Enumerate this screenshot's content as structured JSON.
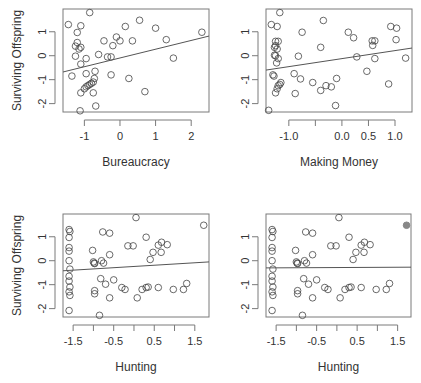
{
  "figure": {
    "ylabel": "Surviving Offspring"
  },
  "chart_data": [
    {
      "type": "scatter",
      "panel": "top-left",
      "title": "",
      "xlabel": "Bureaucracy",
      "ylabel": "Surviving Offspring",
      "xticks": [
        -1,
        0,
        1,
        2
      ],
      "xtick_labels": [
        "-1",
        "0",
        "1",
        "2"
      ],
      "yticks": [
        -2,
        -1,
        0,
        1
      ],
      "ytick_labels": [
        "-2",
        "-1",
        "0",
        "1"
      ],
      "xlim": [
        -1.6,
        2.5
      ],
      "ylim": [
        -2.35,
        1.95
      ],
      "frame_px": {
        "left": 63,
        "right": 209,
        "top": 9,
        "bottom": 112
      },
      "regression_line": {
        "x": [
          -1.6,
          2.5
        ],
        "y": [
          -0.68,
          0.82
        ]
      },
      "points": [
        [
          -1.45,
          1.3
        ],
        [
          -1.1,
          1.25
        ],
        [
          -0.85,
          1.8
        ],
        [
          -1.2,
          0.97
        ],
        [
          -1.25,
          0.4
        ],
        [
          -1.2,
          0.55
        ],
        [
          -1.1,
          0.35
        ],
        [
          -1.15,
          0.28
        ],
        [
          -1.25,
          -0.02
        ],
        [
          -1.1,
          -0.35
        ],
        [
          -0.95,
          -0.12
        ],
        [
          -0.6,
          0.05
        ],
        [
          -0.35,
          -0.05
        ],
        [
          -0.25,
          -0.05
        ],
        [
          -0.45,
          0.62
        ],
        [
          -0.1,
          0.78
        ],
        [
          0.0,
          0.62
        ],
        [
          -0.2,
          0.42
        ],
        [
          0.15,
          1.22
        ],
        [
          0.55,
          1.48
        ],
        [
          0.35,
          0.62
        ],
        [
          1.0,
          1.15
        ],
        [
          1.3,
          0.67
        ],
        [
          1.5,
          -0.1
        ],
        [
          2.3,
          0.98
        ],
        [
          -1.35,
          -0.85
        ],
        [
          -0.95,
          -0.75
        ],
        [
          -0.7,
          -0.65
        ],
        [
          -0.25,
          -0.8
        ],
        [
          0.25,
          -0.95
        ],
        [
          0.7,
          -1.5
        ],
        [
          -0.72,
          -0.95
        ],
        [
          -0.75,
          -1.1
        ],
        [
          -0.8,
          -1.15
        ],
        [
          -0.85,
          -1.2
        ],
        [
          -0.9,
          -1.25
        ],
        [
          -0.95,
          -1.3
        ],
        [
          -1.0,
          -1.38
        ],
        [
          -0.75,
          -1.55
        ],
        [
          -1.1,
          -1.55
        ],
        [
          -0.68,
          -2.1
        ],
        [
          -1.12,
          -2.3
        ]
      ]
    },
    {
      "type": "scatter",
      "panel": "top-right",
      "title": "",
      "xlabel": "Making Money",
      "ylabel": "",
      "xticks": [
        -1.0,
        -0.5,
        0.0,
        0.5,
        1.0
      ],
      "xtick_labels": [
        "-1.0",
        "",
        "0.0",
        "0.5",
        "1.0"
      ],
      "yticks": [
        -2,
        -1,
        0,
        1
      ],
      "ytick_labels": [
        "-2",
        "-1",
        "0",
        "1"
      ],
      "xlim": [
        -1.43,
        1.32
      ],
      "ylim": [
        -2.35,
        1.95
      ],
      "frame_px": {
        "left": 266,
        "right": 412,
        "top": 9,
        "bottom": 112
      },
      "regression_line": {
        "x": [
          -1.43,
          1.32
        ],
        "y": [
          -0.6,
          0.32
        ]
      },
      "points": [
        [
          -1.33,
          1.3
        ],
        [
          -1.22,
          1.22
        ],
        [
          -1.17,
          1.8
        ],
        [
          -0.75,
          0.98
        ],
        [
          -0.35,
          1.47
        ],
        [
          0.12,
          0.98
        ],
        [
          0.22,
          0.75
        ],
        [
          0.57,
          0.62
        ],
        [
          0.62,
          0.62
        ],
        [
          0.58,
          0.43
        ],
        [
          0.92,
          1.22
        ],
        [
          1.03,
          1.15
        ],
        [
          1.02,
          0.67
        ],
        [
          1.2,
          -0.1
        ],
        [
          0.28,
          -0.05
        ],
        [
          0.62,
          -0.12
        ],
        [
          -1.25,
          0.6
        ],
        [
          -1.2,
          0.6
        ],
        [
          -1.25,
          0.42
        ],
        [
          -1.27,
          0.35
        ],
        [
          -1.22,
          0.28
        ],
        [
          -1.27,
          0.02
        ],
        [
          -1.25,
          0.0
        ],
        [
          -1.2,
          -0.12
        ],
        [
          -1.23,
          -0.3
        ],
        [
          -0.82,
          -0.02
        ],
        [
          -0.4,
          0.35
        ],
        [
          0.47,
          -0.65
        ],
        [
          0.88,
          -1.18
        ],
        [
          -1.3,
          -0.8
        ],
        [
          -1.28,
          -0.85
        ],
        [
          -0.9,
          -0.75
        ],
        [
          -0.78,
          -0.97
        ],
        [
          -0.55,
          -1.12
        ],
        [
          -1.15,
          -1.12
        ],
        [
          -1.17,
          -1.2
        ],
        [
          -1.2,
          -1.25
        ],
        [
          -1.22,
          -1.38
        ],
        [
          -1.25,
          -1.55
        ],
        [
          -0.88,
          -1.58
        ],
        [
          -0.4,
          -1.45
        ],
        [
          -0.3,
          -1.25
        ],
        [
          -0.2,
          -1.3
        ],
        [
          -0.1,
          -0.95
        ],
        [
          -0.12,
          -2.08
        ],
        [
          -1.38,
          -2.28
        ]
      ]
    },
    {
      "type": "scatter",
      "panel": "bottom-left",
      "title": "",
      "xlabel": "Hunting",
      "ylabel": "Surviving Offspring",
      "xticks": [
        -1.5,
        -1.0,
        -0.5,
        0.0,
        0.5,
        1.0,
        1.5
      ],
      "xtick_labels": [
        "-1.5",
        "",
        "-0.5",
        "",
        "0.5",
        "",
        "1.5"
      ],
      "yticks": [
        -2,
        -1,
        0,
        1
      ],
      "ytick_labels": [
        "-2",
        "-1",
        "0",
        "1"
      ],
      "xlim": [
        -1.75,
        1.85
      ],
      "ylim": [
        -2.35,
        1.95
      ],
      "frame_px": {
        "left": 63,
        "right": 209,
        "top": 214,
        "bottom": 317
      },
      "regression_line": {
        "x": [
          -1.75,
          1.85
        ],
        "y": [
          -0.42,
          -0.05
        ]
      },
      "points": [
        [
          -1.6,
          1.3
        ],
        [
          -1.58,
          1.22
        ],
        [
          -1.6,
          0.97
        ],
        [
          -1.6,
          0.55
        ],
        [
          -1.6,
          0.4
        ],
        [
          -1.6,
          0.0
        ],
        [
          -1.58,
          -0.35
        ],
        [
          -1.6,
          -0.65
        ],
        [
          -1.6,
          -0.85
        ],
        [
          -1.58,
          -1.1
        ],
        [
          -1.6,
          -1.3
        ],
        [
          -1.58,
          -1.45
        ],
        [
          -1.6,
          -2.08
        ],
        [
          -1.02,
          0.43
        ],
        [
          -1.0,
          -0.05
        ],
        [
          -0.98,
          -0.1
        ],
        [
          -0.97,
          -0.12
        ],
        [
          -0.8,
          0.0
        ],
        [
          -0.75,
          -0.1
        ],
        [
          -0.77,
          1.2
        ],
        [
          -0.6,
          1.15
        ],
        [
          -0.6,
          0.25
        ],
        [
          -0.15,
          0.62
        ],
        [
          -0.02,
          0.62
        ],
        [
          0.3,
          0.98
        ],
        [
          0.05,
          1.8
        ],
        [
          0.4,
          0.05
        ],
        [
          0.47,
          0.35
        ],
        [
          0.6,
          0.65
        ],
        [
          0.68,
          0.77
        ],
        [
          0.67,
          0.35
        ],
        [
          0.82,
          0.67
        ],
        [
          1.72,
          1.48
        ],
        [
          -0.82,
          -0.75
        ],
        [
          -0.7,
          -0.98
        ],
        [
          -0.5,
          -0.8
        ],
        [
          -0.3,
          -1.12
        ],
        [
          -0.22,
          -1.2
        ],
        [
          -0.97,
          -1.25
        ],
        [
          -0.97,
          -1.38
        ],
        [
          -0.6,
          -1.55
        ],
        [
          -0.85,
          -2.28
        ],
        [
          0.08,
          -1.55
        ],
        [
          0.2,
          -1.2
        ],
        [
          0.3,
          -1.12
        ],
        [
          0.35,
          -1.1
        ],
        [
          0.6,
          -1.12
        ],
        [
          0.97,
          -1.2
        ],
        [
          1.22,
          -1.2
        ],
        [
          1.3,
          -0.95
        ]
      ]
    },
    {
      "type": "scatter",
      "panel": "bottom-right",
      "title": "",
      "xlabel": "Hunting",
      "ylabel": "",
      "xticks": [
        -1.5,
        -1.0,
        -0.5,
        0.0,
        0.5,
        1.0,
        1.5
      ],
      "xtick_labels": [
        "-1.5",
        "",
        "-0.5",
        "",
        "0.5",
        "",
        "1.5"
      ],
      "yticks": [
        -2,
        -1,
        0,
        1
      ],
      "ytick_labels": [
        "-2",
        "-1",
        "0",
        "1"
      ],
      "xlim": [
        -1.75,
        1.83
      ],
      "ylim": [
        -2.35,
        1.95
      ],
      "frame_px": {
        "left": 266,
        "right": 411,
        "top": 214,
        "bottom": 317
      },
      "regression_line": {
        "x": [
          -1.75,
          1.83
        ],
        "y": [
          -0.3,
          -0.27
        ]
      },
      "highlighted_point": {
        "x": 1.72,
        "y": 1.48,
        "style": "filled-gray"
      },
      "points": [
        [
          -1.6,
          1.3
        ],
        [
          -1.58,
          1.22
        ],
        [
          -1.6,
          0.97
        ],
        [
          -1.6,
          0.55
        ],
        [
          -1.6,
          0.4
        ],
        [
          -1.6,
          0.0
        ],
        [
          -1.58,
          -0.35
        ],
        [
          -1.6,
          -0.65
        ],
        [
          -1.6,
          -0.85
        ],
        [
          -1.58,
          -1.1
        ],
        [
          -1.6,
          -1.3
        ],
        [
          -1.58,
          -1.45
        ],
        [
          -1.6,
          -2.08
        ],
        [
          -1.02,
          0.43
        ],
        [
          -1.0,
          -0.05
        ],
        [
          -0.98,
          -0.1
        ],
        [
          -0.97,
          -0.12
        ],
        [
          -0.8,
          0.0
        ],
        [
          -0.75,
          -0.1
        ],
        [
          -0.77,
          1.2
        ],
        [
          -0.6,
          1.15
        ],
        [
          -0.6,
          0.25
        ],
        [
          -0.15,
          0.62
        ],
        [
          -0.02,
          0.62
        ],
        [
          0.3,
          0.98
        ],
        [
          0.05,
          1.8
        ],
        [
          0.4,
          0.05
        ],
        [
          0.47,
          0.35
        ],
        [
          0.6,
          0.65
        ],
        [
          0.68,
          0.77
        ],
        [
          0.67,
          0.35
        ],
        [
          0.82,
          0.67
        ],
        [
          -0.82,
          -0.75
        ],
        [
          -0.7,
          -0.98
        ],
        [
          -0.5,
          -0.8
        ],
        [
          -0.3,
          -1.12
        ],
        [
          -0.22,
          -1.2
        ],
        [
          -0.97,
          -1.25
        ],
        [
          -0.97,
          -1.38
        ],
        [
          -0.6,
          -1.55
        ],
        [
          -0.85,
          -2.28
        ],
        [
          0.08,
          -1.55
        ],
        [
          0.2,
          -1.2
        ],
        [
          0.3,
          -1.12
        ],
        [
          0.35,
          -1.1
        ],
        [
          0.6,
          -1.12
        ],
        [
          0.97,
          -1.2
        ],
        [
          1.22,
          -1.2
        ],
        [
          1.3,
          -0.95
        ]
      ]
    }
  ],
  "style": {
    "frame_color": "#7a7a7a",
    "point_stroke": "#444444",
    "line_color": "#555555",
    "highlight_fill": "#888888",
    "text_color": "#333333"
  }
}
